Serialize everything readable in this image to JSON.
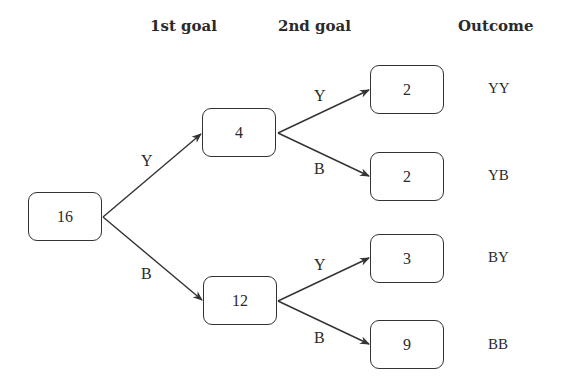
{
  "headers": {
    "first_goal": "1st goal",
    "second_goal": "2nd goal",
    "outcome": "Outcome"
  },
  "nodes": {
    "root": "16",
    "y": "4",
    "b": "12",
    "yy": "2",
    "yb": "2",
    "by": "3",
    "bb": "9"
  },
  "branch_labels": {
    "root_y": "Y",
    "root_b": "B",
    "y_y": "Y",
    "y_b": "B",
    "b_y": "Y",
    "b_b": "B"
  },
  "outcomes": [
    "YY",
    "YB",
    "BY",
    "BB"
  ],
  "colors": {
    "line": "#333333",
    "text": "#2a2a2a",
    "background": "#ffffff"
  }
}
